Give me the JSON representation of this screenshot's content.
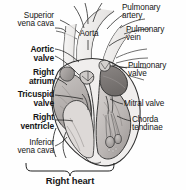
{
  "figure": {
    "title": "Right heart",
    "background_color": "#fefefe",
    "ink_color": "#161616"
  },
  "caption": {
    "text": "Right heart",
    "bold": true
  },
  "labels": {
    "superior_vena_cava": "Superior\nvena cava",
    "aortic_valve": "Aortic\nvalve",
    "right_atrium": "Right\natrium",
    "tricuspid_valve": "Tricuspid\nvalve",
    "right_ventricle": "Right\nventricle",
    "inferior_vena_cava": "Inferior\nvena cava",
    "aorta": "Aorta",
    "pulmonary_artery": "Pulmonary\nartery",
    "pulmonary_vein": "Pulmonary\nvein",
    "pulmonary_valve": "Pulmonary\nvalve",
    "mitral_valve": "Mitral valve",
    "chorda_tendinae": "Chorda\ntendinae"
  },
  "label_styles": {
    "superior_vena_cava": "regular",
    "aortic_valve": "bold",
    "right_atrium": "bold",
    "tricuspid_valve": "bold",
    "right_ventricle": "bold",
    "inferior_vena_cava": "regular",
    "aorta": "regular",
    "pulmonary_artery": "regular",
    "pulmonary_vein": "regular",
    "pulmonary_valve": "regular",
    "mitral_valve": "regular",
    "chorda_tendinae": "regular"
  }
}
